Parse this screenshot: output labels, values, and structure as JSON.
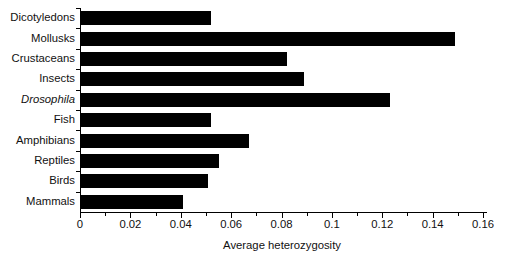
{
  "chart_data": {
    "type": "bar",
    "orientation": "horizontal",
    "title": "",
    "xlabel": "Average heterozygosity",
    "ylabel": "",
    "xlim": [
      0,
      0.16
    ],
    "grid": false,
    "legend": null,
    "bar_color": "#000000",
    "axis_color": "#000000",
    "xticks": [
      0,
      0.02,
      0.04,
      0.06,
      0.08,
      0.1,
      0.12,
      0.14,
      0.16
    ],
    "xtick_labels": [
      "0",
      "0.02",
      "0.04",
      "0.06",
      "0.08",
      "0.1",
      "0.12",
      "0.14",
      "0.16"
    ],
    "xtick_minor_step": 0.01,
    "categories": [
      "Dicotyledons",
      "Mollusks",
      "Crustaceans",
      "Insects",
      "Drosophila",
      "Fish",
      "Amphibians",
      "Reptiles",
      "Birds",
      "Mammals"
    ],
    "italic_categories": [
      "Drosophila"
    ],
    "values": [
      0.052,
      0.149,
      0.082,
      0.089,
      0.123,
      0.052,
      0.067,
      0.055,
      0.051,
      0.041
    ]
  }
}
